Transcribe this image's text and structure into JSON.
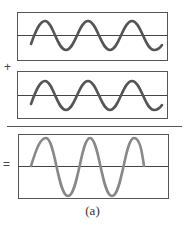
{
  "figure": {
    "caption": "(a)",
    "operators": {
      "plus": "+",
      "equals": "="
    },
    "panels": [
      {
        "name": "wave-1",
        "cycles": 3,
        "amplitude": "A",
        "color": "#555555"
      },
      {
        "name": "wave-2",
        "cycles": 3,
        "amplitude": "A",
        "color": "#555555"
      },
      {
        "name": "sum-wave",
        "cycles": 2.5,
        "amplitude": "2A",
        "color": "#888888"
      }
    ]
  }
}
